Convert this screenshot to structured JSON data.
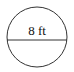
{
  "diagram": {
    "shape": "circle",
    "diameter_label": "8 ft",
    "stroke_color": "#333333",
    "background": "#ffffff"
  }
}
